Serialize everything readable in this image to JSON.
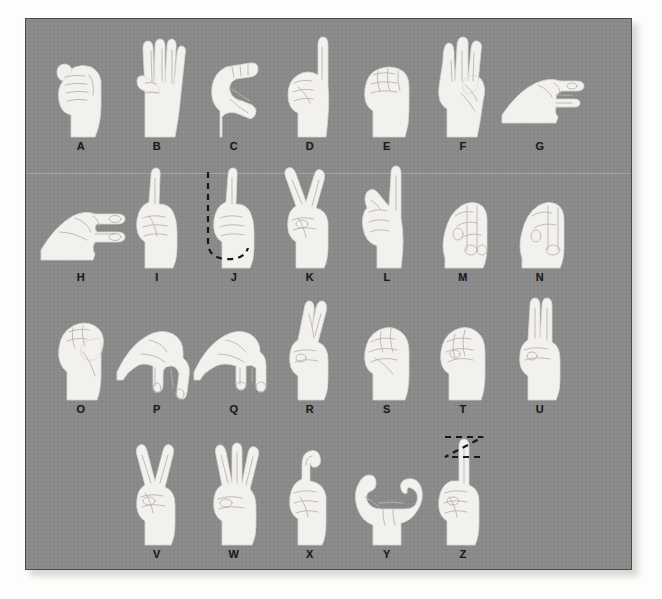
{
  "chart": {
    "plate_background_color": "#8b8b8b",
    "hand_color": "#f2f1ed",
    "label_color": "#1c1c1c",
    "motion_line_color": "#181818",
    "rows": [
      {
        "row_index": 1,
        "cells": [
          {
            "label": "A",
            "sign": "closed-fist-thumb-at-side",
            "motion": "none"
          },
          {
            "label": "B",
            "sign": "flat-hand-fingers-up-thumb-across-palm",
            "motion": "none"
          },
          {
            "label": "C",
            "sign": "curved-hand-c-shape",
            "motion": "none"
          },
          {
            "label": "D",
            "sign": "index-finger-up-other-fingers-to-thumb",
            "motion": "none"
          },
          {
            "label": "E",
            "sign": "fingers-curled-down-thumb-tucked",
            "motion": "none"
          },
          {
            "label": "F",
            "sign": "index-and-thumb-touching-three-fingers-up",
            "motion": "none"
          },
          {
            "label": "G",
            "sign": "index-finger-pointing-sideways-thumb-parallel",
            "motion": "none"
          }
        ]
      },
      {
        "row_index": 2,
        "cells": [
          {
            "label": "H",
            "sign": "index-and-middle-fingers-pointing-sideways",
            "motion": "none"
          },
          {
            "label": "I",
            "sign": "pinky-finger-up-fist",
            "motion": "none"
          },
          {
            "label": "J",
            "sign": "pinky-up-tracing-j-in-air",
            "motion": "j-hook-trace"
          },
          {
            "label": "K",
            "sign": "index-and-middle-up-thumb-between",
            "motion": "none"
          },
          {
            "label": "L",
            "sign": "index-up-thumb-out-l-shape",
            "motion": "none"
          },
          {
            "label": "M",
            "sign": "thumb-under-three-fingers",
            "motion": "none"
          },
          {
            "label": "N",
            "sign": "thumb-under-two-fingers",
            "motion": "none"
          }
        ]
      },
      {
        "row_index": 3,
        "cells": [
          {
            "label": "O",
            "sign": "fingers-curved-to-thumb-o-shape",
            "motion": "none"
          },
          {
            "label": "P",
            "sign": "k-hand-pointing-downward",
            "motion": "none"
          },
          {
            "label": "Q",
            "sign": "g-hand-pointing-downward",
            "motion": "none"
          },
          {
            "label": "R",
            "sign": "index-and-middle-fingers-crossed",
            "motion": "none"
          },
          {
            "label": "S",
            "sign": "fist-thumb-across-front",
            "motion": "none"
          },
          {
            "label": "T",
            "sign": "thumb-between-index-and-middle",
            "motion": "none"
          },
          {
            "label": "U",
            "sign": "index-and-middle-fingers-up-together",
            "motion": "none"
          }
        ]
      },
      {
        "row_index": 4,
        "cells": [
          {
            "label": "V",
            "sign": "index-and-middle-fingers-up-apart",
            "motion": "none"
          },
          {
            "label": "W",
            "sign": "three-fingers-up-spread",
            "motion": "none"
          },
          {
            "label": "X",
            "sign": "index-finger-hooked",
            "motion": "none"
          },
          {
            "label": "Y",
            "sign": "thumb-and-pinky-extended",
            "motion": "none"
          },
          {
            "label": "Z",
            "sign": "index-finger-tracing-z-in-air",
            "motion": "z-zigzag-trace"
          }
        ]
      }
    ]
  }
}
